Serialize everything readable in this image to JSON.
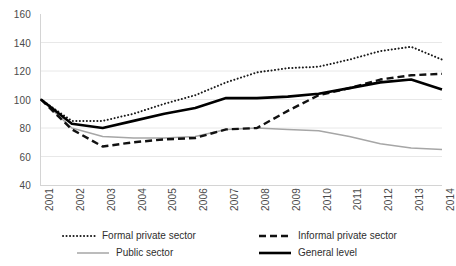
{
  "chart_data": {
    "type": "line",
    "title": "",
    "xlabel": "",
    "ylabel": "",
    "ylim": [
      40,
      160
    ],
    "ytick_step": 20,
    "yticks": [
      160,
      140,
      120,
      100,
      80,
      60,
      40
    ],
    "grid": true,
    "grid_axis": "y",
    "legend_position": "bottom",
    "categories": [
      "2001",
      "2002",
      "2003",
      "2004",
      "2005",
      "2006",
      "2007",
      "2008",
      "2009",
      "2010",
      "2011",
      "2012",
      "2013",
      "2014"
    ],
    "series": [
      {
        "name": "Formal private sector",
        "style": "dotted",
        "color": "#1a1a1a",
        "values": [
          100,
          85,
          85,
          90,
          97,
          103,
          112,
          119,
          122,
          123,
          128,
          134,
          137,
          128
        ]
      },
      {
        "name": "Informal private sector",
        "style": "dashed",
        "color": "#111111",
        "values": [
          100,
          79,
          67,
          70,
          72,
          73,
          79,
          80,
          92,
          103,
          108,
          114,
          117,
          118
        ]
      },
      {
        "name": "Public sector",
        "style": "solid-thin",
        "color": "#a6a6a6",
        "values": [
          100,
          80,
          74,
          73,
          73,
          74,
          79,
          80,
          79,
          78,
          74,
          69,
          66,
          65
        ]
      },
      {
        "name": "General level",
        "style": "solid-thick",
        "color": "#000000",
        "values": [
          100,
          83,
          80,
          85,
          90,
          94,
          101,
          101,
          102,
          104,
          108,
          112,
          114,
          107
        ]
      }
    ]
  },
  "legend": {
    "items": [
      {
        "label": "Formal private sector"
      },
      {
        "label": "Informal private sector"
      },
      {
        "label": "Public sector"
      },
      {
        "label": "General level"
      }
    ]
  }
}
